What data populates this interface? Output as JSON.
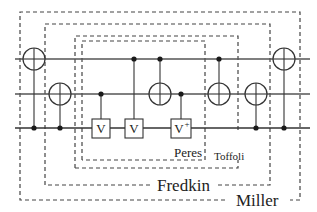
{
  "diagram": {
    "type": "reversible-circuit",
    "wires": [
      {
        "id": "w1",
        "y": 59
      },
      {
        "id": "w2",
        "y": 94
      },
      {
        "id": "w3",
        "y": 128
      }
    ],
    "gates": [
      {
        "col": 1,
        "kind": "cnot",
        "control": "w3",
        "target": "w1"
      },
      {
        "col": 2,
        "kind": "cnot",
        "control": "w3",
        "target": "w2"
      },
      {
        "col": 3,
        "kind": "controlled-V",
        "control": "w2",
        "target": "w3",
        "label": "V"
      },
      {
        "col": 4,
        "kind": "controlled-V",
        "control": "w1",
        "target": "w3",
        "label": "V"
      },
      {
        "col": 5,
        "kind": "cnot",
        "control": "w1",
        "target": "w2"
      },
      {
        "col": 6,
        "kind": "controlled-V-dagger",
        "control": "w2",
        "target": "w3",
        "label": "V",
        "superscript": "+"
      },
      {
        "col": 7,
        "kind": "cnot",
        "control": "w1",
        "target": "w2"
      },
      {
        "col": 8,
        "kind": "cnot",
        "control": "w3",
        "target": "w2"
      },
      {
        "col": 9,
        "kind": "cnot",
        "control": "w3",
        "target": "w1"
      }
    ],
    "gate_labels": {
      "v1": "V",
      "v2": "V",
      "v3": "V",
      "v3_sup": "+"
    },
    "groupings": {
      "peres": "Peres",
      "toffoli": "Toffoli",
      "fredkin": "Fredkin",
      "miller": "Miller"
    }
  }
}
